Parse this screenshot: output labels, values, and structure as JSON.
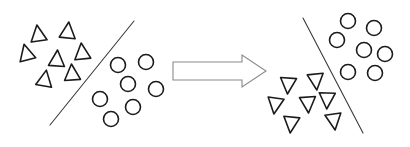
{
  "figure": {
    "width": 410,
    "height": 147,
    "background_color": "#ffffff",
    "shape_stroke_color": "#1b1b1b",
    "separator_stroke_color": "#3a3a3a",
    "arrow_stroke_color": "#8a8a8a",
    "arrow_fill_color": "#ffffff",
    "shape_fill_color": "#ffffff"
  },
  "panels": [
    {
      "id": "before",
      "label": "before-panel",
      "separator": {
        "x1": 134,
        "y1": 21,
        "x2": 50,
        "y2": 125
      },
      "groups": [
        {
          "id": "triangles-up",
          "label": "triangle-group-upward",
          "marker": "triangle-up",
          "count": 7,
          "side": "left",
          "size": 16,
          "points": [
            {
              "cx": 38,
              "cy": 33,
              "rot": -8
            },
            {
              "cx": 68,
              "cy": 30,
              "rot": 6
            },
            {
              "cx": 26,
              "cy": 52,
              "rot": -14
            },
            {
              "cx": 57,
              "cy": 58,
              "rot": 4
            },
            {
              "cx": 82,
              "cy": 51,
              "rot": -6
            },
            {
              "cx": 45,
              "cy": 78,
              "rot": 10
            },
            {
              "cx": 72,
              "cy": 72,
              "rot": -4
            }
          ]
        },
        {
          "id": "circles",
          "label": "circle-group",
          "marker": "circle",
          "count": 7,
          "side": "right",
          "size": 15,
          "points": [
            {
              "cx": 118,
              "cy": 65
            },
            {
              "cx": 146,
              "cy": 62
            },
            {
              "cx": 128,
              "cy": 84
            },
            {
              "cx": 156,
              "cy": 89
            },
            {
              "cx": 100,
              "cy": 99
            },
            {
              "cx": 133,
              "cy": 107
            },
            {
              "cx": 111,
              "cy": 119
            }
          ]
        }
      ]
    },
    {
      "id": "after",
      "label": "after-panel",
      "separator": {
        "x1": 303,
        "y1": 18,
        "x2": 363,
        "y2": 133
      },
      "groups": [
        {
          "id": "triangles-down",
          "label": "triangle-group-downward",
          "marker": "triangle-down",
          "count": 7,
          "side": "left",
          "size": 16,
          "points": [
            {
              "cx": 288,
              "cy": 86,
              "rot": 4
            },
            {
              "cx": 316,
              "cy": 82,
              "rot": -6
            },
            {
              "cx": 275,
              "cy": 106,
              "rot": 8
            },
            {
              "cx": 308,
              "cy": 105,
              "rot": -4
            },
            {
              "cx": 291,
              "cy": 125,
              "rot": 6
            },
            {
              "cx": 334,
              "cy": 122,
              "rot": -8
            },
            {
              "cx": 327,
              "cy": 101,
              "rot": 2
            }
          ]
        },
        {
          "id": "circles",
          "label": "circle-group",
          "marker": "circle",
          "count": 7,
          "side": "right",
          "size": 15,
          "points": [
            {
              "cx": 348,
              "cy": 21
            },
            {
              "cx": 374,
              "cy": 28
            },
            {
              "cx": 337,
              "cy": 40
            },
            {
              "cx": 364,
              "cy": 50
            },
            {
              "cx": 385,
              "cy": 54
            },
            {
              "cx": 348,
              "cy": 72
            },
            {
              "cx": 375,
              "cy": 73
            }
          ]
        }
      ]
    }
  ],
  "arrow": {
    "label": "transformation-arrow",
    "direction": "right",
    "x_start": 173,
    "x_tip": 266,
    "y_center": 71,
    "shaft_height": 18,
    "head_height": 32,
    "head_length": 24
  }
}
